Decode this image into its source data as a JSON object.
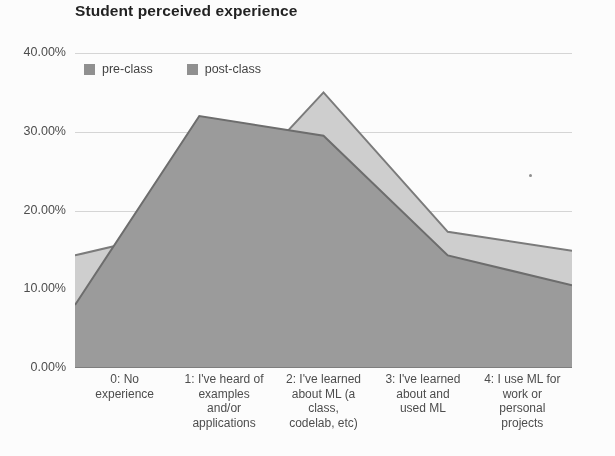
{
  "chart_data": {
    "type": "area",
    "title": "Student perceived experience",
    "xlabel": "",
    "ylabel": "",
    "ylim": [
      0,
      40
    ],
    "ytick_labels": [
      "40.00%",
      "30.00%",
      "20.00%",
      "10.00%",
      "0.00%"
    ],
    "ytick_values": [
      40,
      30,
      20,
      10,
      0
    ],
    "grid": true,
    "legend_position": "top-left",
    "categories": [
      "0: No experience",
      "1: I've heard of examples and/or applications",
      "2: I've learned about ML (a class, codelab, etc)",
      "3: I've learned about and used ML",
      "4: I use ML for work or personal projects"
    ],
    "category_lines": [
      [
        "0: No",
        "experience"
      ],
      [
        "1: I've heard of",
        "examples",
        "and/or",
        "applications"
      ],
      [
        "2: I've learned",
        "about ML (a",
        "class,",
        "codelab, etc)"
      ],
      [
        "3: I've learned",
        "about and",
        "used ML"
      ],
      [
        "4: I use ML for",
        "work or",
        "personal",
        "projects"
      ]
    ],
    "series": [
      {
        "name": "pre-class",
        "values": [
          8.0,
          32.0,
          29.5,
          14.3,
          10.5
        ],
        "color": "#9b9b9b",
        "line_color": "#6b6b6b"
      },
      {
        "name": "post-class",
        "values": [
          14.3,
          18.0,
          35.0,
          17.3,
          14.9
        ],
        "color": "#cfcfcf",
        "line_color": "#7a7a7a"
      }
    ]
  },
  "legend": {
    "items": [
      {
        "label": "pre-class",
        "swatch": "#8f8f8f"
      },
      {
        "label": "post-class",
        "swatch": "#8f8f8f"
      }
    ]
  },
  "colors": {
    "gridline": "#d6d6d6",
    "axis": "#7d7d7d",
    "title": "#1d1d1d",
    "tick_text": "#4a4a4a"
  }
}
